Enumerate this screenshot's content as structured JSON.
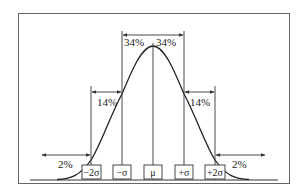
{
  "diagram": {
    "type": "normal-distribution",
    "colors": {
      "stroke": "#333333",
      "frame": "#555555",
      "background": "#ffffff"
    },
    "markers": [
      {
        "id": "minus-2sigma",
        "label": "−2σ"
      },
      {
        "id": "minus-sigma",
        "label": "−σ"
      },
      {
        "id": "mu",
        "label": "μ"
      },
      {
        "id": "plus-sigma",
        "label": "+σ"
      },
      {
        "id": "plus-2sigma",
        "label": "+2σ"
      }
    ],
    "percentages": {
      "left_tail": "2%",
      "left_14": "14%",
      "left_34": "34%",
      "right_34": "34%",
      "right_14": "14%",
      "right_tail": "2%"
    }
  }
}
